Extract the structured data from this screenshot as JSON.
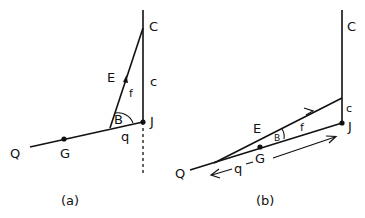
{
  "panels": [
    {
      "caption": "(a)",
      "labels": {
        "C_upper": "C",
        "c_lower": "c",
        "E": "E",
        "f": "f",
        "B": "B",
        "J": "J",
        "q": "q",
        "G": "G",
        "Q": "Q"
      }
    },
    {
      "caption": "(b)",
      "labels": {
        "C_upper": "C",
        "c_lower": "c",
        "E": "E",
        "f": "f",
        "B": "B",
        "J": "J",
        "q": "q",
        "G": "G",
        "Q": "Q"
      }
    }
  ],
  "colors": {
    "line": "#111111",
    "background": "#ffffff"
  }
}
